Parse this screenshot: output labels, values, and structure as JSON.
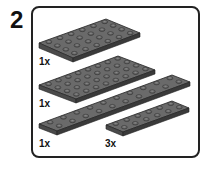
{
  "step": {
    "number": "2"
  },
  "parts": [
    {
      "qty": "1x",
      "part": "plate-4x6",
      "color": "#5a5a5a"
    },
    {
      "qty": "1x",
      "part": "plate-4x8",
      "color": "#5a5a5a"
    },
    {
      "qty": "1x",
      "part": "plate-2x10",
      "color": "#5a5a5a"
    },
    {
      "qty": "3x",
      "part": "plate-2x6",
      "color": "#5a5a5a"
    }
  ]
}
